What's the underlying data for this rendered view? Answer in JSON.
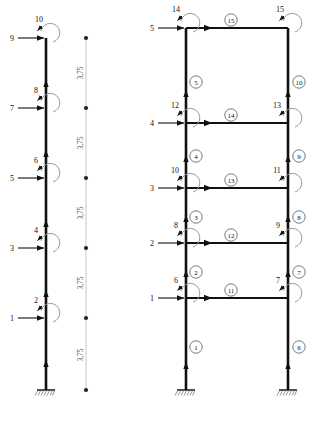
{
  "figure": {
    "colors": {
      "member": "#111111",
      "dimension": "#9a9a9a",
      "moment_arc": "#9a9a9a",
      "text": "#111111",
      "background": "#ffffff"
    }
  },
  "left_model": {
    "name": "single-column-cantilever-model",
    "storey_count": 5,
    "support": {
      "type": "fixed-support",
      "label": ""
    },
    "dof_translation_labels": [
      "1",
      "3",
      "5",
      "7",
      "9"
    ],
    "dof_rotation_labels": [
      "2",
      "4",
      "6",
      "8",
      "10"
    ],
    "nodes": [
      {
        "translation_dof": "1",
        "rotation_dof": "2"
      },
      {
        "translation_dof": "3",
        "rotation_dof": "4"
      },
      {
        "translation_dof": "5",
        "rotation_dof": "6"
      },
      {
        "translation_dof": "7",
        "rotation_dof": "8"
      },
      {
        "translation_dof": "9",
        "rotation_dof": "10"
      }
    ]
  },
  "dimension_chain": {
    "name": "storey-height-dimension-chain",
    "unit_note": "",
    "segments": [
      "3,75",
      "3,75",
      "3,75",
      "3,75",
      "3,75"
    ],
    "tick_count": 6
  },
  "right_model": {
    "name": "two-bay-frame-element-model",
    "storey_count": 5,
    "supports": [
      {
        "type": "fixed-support",
        "position": "left"
      },
      {
        "type": "fixed-support",
        "position": "right"
      }
    ],
    "left_dof_translation_labels": [
      "1",
      "2",
      "3",
      "4",
      "5"
    ],
    "left_dof_rotation_labels": [
      "6",
      "8",
      "10",
      "12",
      "14"
    ],
    "right_dof_rotation_labels": [
      "7",
      "9",
      "11",
      "13",
      "15"
    ],
    "left_column_elements": [
      "1",
      "2",
      "3",
      "4",
      "5"
    ],
    "right_column_elements": [
      "6",
      "7",
      "8",
      "9",
      "10"
    ],
    "beam_elements": [
      "11",
      "12",
      "13",
      "14",
      "15"
    ],
    "nodes": [
      {
        "level": 1,
        "translation_dof": "1",
        "left_rotation_dof": "6",
        "right_rotation_dof": "7",
        "beam_element": "11",
        "left_column_element": "1",
        "right_column_element": "6"
      },
      {
        "level": 2,
        "translation_dof": "2",
        "left_rotation_dof": "8",
        "right_rotation_dof": "9",
        "beam_element": "12",
        "left_column_element": "2",
        "right_column_element": "7"
      },
      {
        "level": 3,
        "translation_dof": "3",
        "left_rotation_dof": "10",
        "right_rotation_dof": "11",
        "beam_element": "13",
        "left_column_element": "3",
        "right_column_element": "8"
      },
      {
        "level": 4,
        "translation_dof": "4",
        "left_rotation_dof": "12",
        "right_rotation_dof": "13",
        "beam_element": "14",
        "left_column_element": "4",
        "right_column_element": "9"
      },
      {
        "level": 5,
        "translation_dof": "5",
        "left_rotation_dof": "14",
        "right_rotation_dof": "15",
        "beam_element": "15",
        "left_column_element": "5",
        "right_column_element": "10"
      }
    ]
  }
}
